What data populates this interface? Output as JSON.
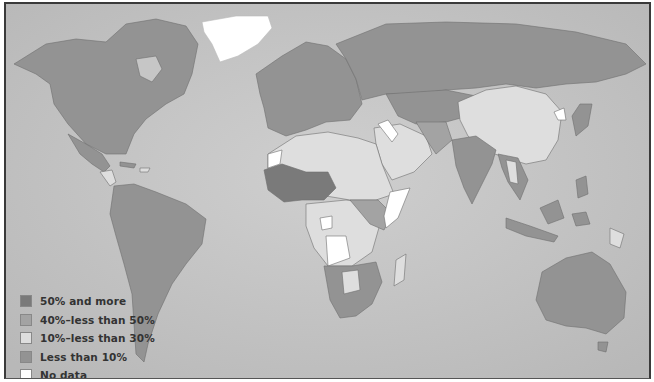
{
  "map": {
    "type": "choropleth",
    "ocean_color": "#c2c2c2",
    "legend": [
      {
        "label": "50% and more",
        "color": "#7a7a7a"
      },
      {
        "label": "40%–less than 50%",
        "color": "#a3a3a3"
      },
      {
        "label": "10%–less than 30%",
        "color": "#dedede"
      },
      {
        "label": "Less than 10%",
        "color": "#939393"
      },
      {
        "label": "No data",
        "color": "#ffffff"
      }
    ]
  }
}
